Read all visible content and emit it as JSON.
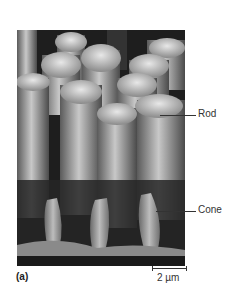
{
  "figure": {
    "panel_letter": "(a)",
    "labels": {
      "rod": "Rod",
      "cone": "Cone"
    },
    "scale_bar": {
      "text": "2 µm"
    },
    "image_description": "Scanning electron micrograph of retinal rods and cones"
  }
}
